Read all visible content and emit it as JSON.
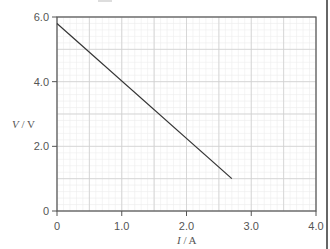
{
  "chart_data": {
    "type": "line",
    "title": "",
    "xlabel": "I / A",
    "ylabel": "V / V",
    "xlim": [
      0,
      4.0
    ],
    "ylim": [
      0,
      6.0
    ],
    "x_ticks": [
      0,
      1.0,
      2.0,
      3.0,
      4.0
    ],
    "x_tick_labels": [
      "0",
      "1.0",
      "2.0",
      "3.0",
      "4.0"
    ],
    "y_ticks": [
      0,
      2.0,
      4.0,
      6.0
    ],
    "y_tick_labels": [
      "0",
      "2.0",
      "4.0",
      "6.0"
    ],
    "grid": true,
    "grid_major": {
      "x_step": 0.5,
      "y_step": 1.0
    },
    "grid_minor": {
      "x_step": 0.1,
      "y_step": 0.2
    },
    "legend": null,
    "series": [
      {
        "name": "V against I",
        "x": [
          0,
          2.7
        ],
        "y": [
          5.8,
          1.0
        ],
        "color": "#333333"
      }
    ]
  },
  "labels": {
    "x_axis_symbol": "I",
    "x_axis_unit": " / A",
    "y_axis_symbol": "V",
    "y_axis_unit": " / V"
  },
  "colors": {
    "axis": "#555555",
    "grid_major": "#cfcfcf",
    "grid_minor": "#ececec",
    "line": "#333333"
  }
}
